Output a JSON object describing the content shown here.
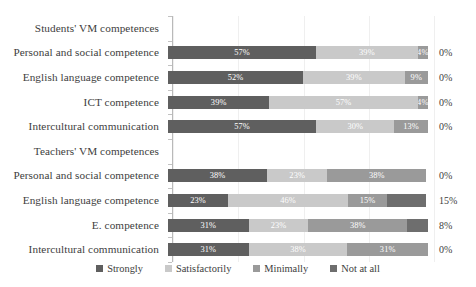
{
  "chart_data": {
    "type": "bar",
    "subtype": "stacked-horizontal-100-percent",
    "title": "",
    "xlabel": "",
    "ylabel": "",
    "xlim": [
      0,
      100
    ],
    "grid": true,
    "grid_axis": "x",
    "legend_position": "bottom",
    "categories": [
      "Students' VM competences",
      "Personal and social competence",
      "English language competence",
      "ICT competence",
      "Intercultural communication",
      "Teachers' VM competences",
      "Personal and social competence",
      "English language competence",
      "E.  competence",
      "Intercultural communication"
    ],
    "series": [
      {
        "name": "Strongly",
        "color": "#5f5f5f",
        "values": [
          null,
          57,
          52,
          39,
          57,
          null,
          38,
          23,
          31,
          31
        ]
      },
      {
        "name": "Satisfactorily",
        "color": "#c9c9c9",
        "values": [
          null,
          39,
          39,
          57,
          30,
          null,
          23,
          46,
          23,
          38
        ]
      },
      {
        "name": "Minimally",
        "color": "#9a9a9a",
        "values": [
          null,
          4,
          9,
          4,
          13,
          null,
          38,
          15,
          38,
          31
        ]
      },
      {
        "name": "Not at all",
        "color": "#6e6e6e",
        "values": [
          null,
          0,
          0,
          0,
          0,
          null,
          0,
          15,
          8,
          0
        ]
      }
    ]
  },
  "rows": [
    {
      "label": "Students' VM competences",
      "is_group": true,
      "segments": [],
      "outside_value": ""
    },
    {
      "label": "Personal and social competence",
      "is_group": false,
      "segments": [
        {
          "series": "Strongly",
          "value": 57,
          "label": "57%"
        },
        {
          "series": "Satisfactorily",
          "value": 39,
          "label": "39%"
        },
        {
          "series": "Minimally",
          "value": 4,
          "label": "4%"
        }
      ],
      "outside_value": "0%"
    },
    {
      "label": "English language competence",
      "is_group": false,
      "segments": [
        {
          "series": "Strongly",
          "value": 52,
          "label": "52%"
        },
        {
          "series": "Satisfactorily",
          "value": 39,
          "label": "39%"
        },
        {
          "series": "Minimally",
          "value": 9,
          "label": "9%"
        }
      ],
      "outside_value": "0%"
    },
    {
      "label": "ICT competence",
      "is_group": false,
      "segments": [
        {
          "series": "Strongly",
          "value": 39,
          "label": "39%"
        },
        {
          "series": "Satisfactorily",
          "value": 57,
          "label": "57%"
        },
        {
          "series": "Minimally",
          "value": 4,
          "label": "4%"
        }
      ],
      "outside_value": "0%"
    },
    {
      "label": "Intercultural communication",
      "is_group": false,
      "segments": [
        {
          "series": "Strongly",
          "value": 57,
          "label": "57%"
        },
        {
          "series": "Satisfactorily",
          "value": 30,
          "label": "30%"
        },
        {
          "series": "Minimally",
          "value": 13,
          "label": "13%"
        }
      ],
      "outside_value": "0%"
    },
    {
      "label": "Teachers' VM competences",
      "is_group": true,
      "segments": [],
      "outside_value": ""
    },
    {
      "label": "Personal and social competence",
      "is_group": false,
      "segments": [
        {
          "series": "Strongly",
          "value": 38,
          "label": "38%"
        },
        {
          "series": "Satisfactorily",
          "value": 23,
          "label": "23%"
        },
        {
          "series": "Minimally",
          "value": 38,
          "label": "38%"
        }
      ],
      "outside_value": "0%"
    },
    {
      "label": "English language competence",
      "is_group": false,
      "segments": [
        {
          "series": "Strongly",
          "value": 23,
          "label": "23%"
        },
        {
          "series": "Satisfactorily",
          "value": 46,
          "label": "46%"
        },
        {
          "series": "Minimally",
          "value": 15,
          "label": "15%"
        },
        {
          "series": "Not at all",
          "value": 15,
          "label": ""
        }
      ],
      "outside_value": "15%"
    },
    {
      "label": "E.  competence",
      "is_group": false,
      "segments": [
        {
          "series": "Strongly",
          "value": 31,
          "label": "31%"
        },
        {
          "series": "Satisfactorily",
          "value": 23,
          "label": "23%"
        },
        {
          "series": "Minimally",
          "value": 38,
          "label": "38%"
        },
        {
          "series": "Not at all",
          "value": 8,
          "label": ""
        }
      ],
      "outside_value": "8%"
    },
    {
      "label": "Intercultural communication",
      "is_group": false,
      "segments": [
        {
          "series": "Strongly",
          "value": 31,
          "label": "31%"
        },
        {
          "series": "Satisfactorily",
          "value": 38,
          "label": "38%"
        },
        {
          "series": "Minimally",
          "value": 31,
          "label": "31%"
        }
      ],
      "outside_value": "0%"
    }
  ],
  "legend": {
    "items": [
      {
        "label": "Strongly",
        "color": "#5f5f5f",
        "key": "strongly"
      },
      {
        "label": "Satisfactorily",
        "color": "#c9c9c9",
        "key": "satisfactorily"
      },
      {
        "label": "Minimally",
        "color": "#9a9a9a",
        "key": "minimally"
      },
      {
        "label": "Not at all",
        "color": "#6e6e6e",
        "key": "notatall"
      }
    ]
  },
  "gridlines": {
    "count": 5,
    "positions_pct": [
      0,
      25,
      50,
      75,
      100
    ]
  }
}
